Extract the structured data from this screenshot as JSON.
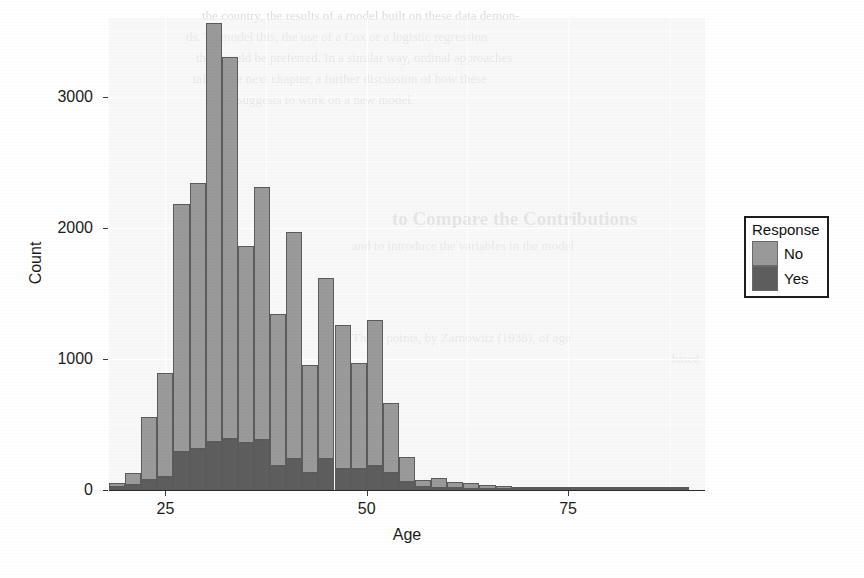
{
  "chart_data": {
    "type": "bar",
    "subtype": "stacked-histogram",
    "title": "",
    "xlabel": "Age",
    "ylabel": "Count",
    "xlim": [
      18,
      92
    ],
    "ylim": [
      0,
      3600
    ],
    "bin_width": 2,
    "grid": true,
    "legend": {
      "title": "Response",
      "position": "right",
      "entries": [
        {
          "label": "No",
          "color": "#9a9a9a"
        },
        {
          "label": "Yes",
          "color": "#5e5e5e"
        }
      ]
    },
    "x_ticks": [
      25,
      50,
      75
    ],
    "x_tick_labels": [
      "25",
      "50",
      "75"
    ],
    "y_ticks": [
      0,
      1000,
      2000,
      3000
    ],
    "y_tick_labels": [
      "0",
      "1000",
      "2000",
      "3000"
    ],
    "x": [
      19,
      21,
      23,
      25,
      27,
      29,
      31,
      33,
      35,
      37,
      39,
      41,
      43,
      45,
      47,
      49,
      51,
      53,
      55,
      57,
      59,
      61,
      63,
      65,
      67,
      69,
      71,
      73,
      75,
      77,
      79,
      81,
      83,
      85,
      87,
      89
    ],
    "bin_labels": [
      "18-20",
      "20-22",
      "22-24",
      "24-26",
      "26-28",
      "28-30",
      "30-32",
      "32-34",
      "34-36",
      "36-38",
      "38-40",
      "40-42",
      "42-44",
      "44-46",
      "46-48",
      "48-50",
      "50-52",
      "52-54",
      "54-56",
      "56-58",
      "58-60",
      "60-62",
      "62-64",
      "64-66",
      "66-68",
      "68-70",
      "70-72",
      "72-74",
      "74-76",
      "76-78",
      "78-80",
      "80-82",
      "82-84",
      "84-86",
      "86-88",
      "88-90"
    ],
    "series": [
      {
        "name": "No",
        "color": "#9a9a9a",
        "values": [
          35,
          90,
          480,
          790,
          1890,
          2030,
          3190,
          2910,
          1500,
          1930,
          1160,
          1730,
          820,
          1380,
          1100,
          810,
          1120,
          530,
          190,
          60,
          75,
          50,
          45,
          30,
          22,
          15,
          12,
          10,
          8,
          6,
          4,
          3,
          2,
          2,
          1,
          1
        ]
      },
      {
        "name": "Yes",
        "color": "#5e5e5e",
        "values": [
          20,
          40,
          80,
          100,
          290,
          310,
          370,
          390,
          360,
          380,
          180,
          240,
          130,
          240,
          160,
          160,
          180,
          130,
          60,
          20,
          15,
          12,
          10,
          8,
          6,
          5,
          4,
          3,
          3,
          2,
          2,
          1,
          1,
          1,
          1,
          1
        ]
      }
    ],
    "totals": [
      55,
      130,
      560,
      890,
      2180,
      2340,
      3560,
      3300,
      1860,
      2310,
      1340,
      1970,
      950,
      1620,
      1260,
      970,
      1300,
      660,
      250,
      80,
      90,
      62,
      55,
      38,
      28,
      20,
      16,
      13,
      11,
      8,
      6,
      4,
      3,
      3,
      2,
      2
    ]
  },
  "background_text": {
    "header_lines": [
      "the country, the results of a model built on these data demon-",
      "ds. To model this, the use of a Cox or a logistic regression",
      "that would be preferred.  In a similar way, ordinal approaches",
      "tal. In the next chapter, a further discussion of how these",
      "tion suggests to work on a new model."
    ],
    "section_heading": "to Compare the Contributions",
    "section_lines": [
      "and to introduce the variables in the model"
    ],
    "footer_lines": [
      "These points, by Zarnowitz (1938), of age",
      "based"
    ]
  }
}
